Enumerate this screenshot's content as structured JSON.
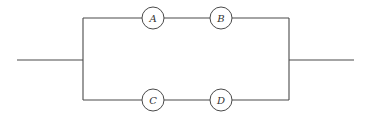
{
  "diagram": {
    "type": "parallel-series circuit",
    "branches": [
      {
        "name": "top",
        "components": [
          "A",
          "B"
        ]
      },
      {
        "name": "bottom",
        "components": [
          "C",
          "D"
        ]
      }
    ],
    "colors": {
      "line": "#4a4a4a",
      "background": "#ffffff"
    }
  }
}
